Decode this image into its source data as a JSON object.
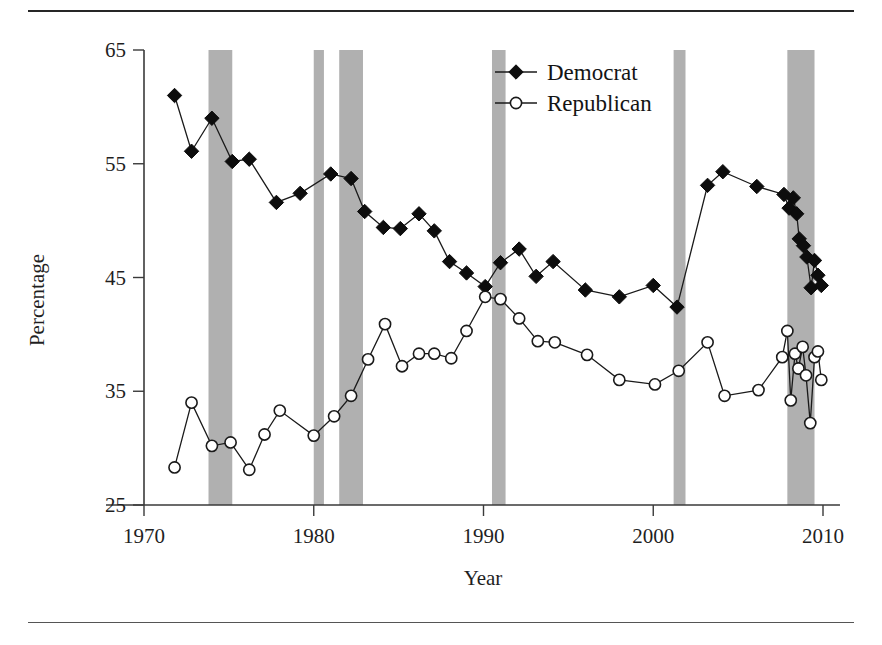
{
  "chart_data": {
    "type": "line",
    "title": "",
    "xlabel": "Year",
    "ylabel": "Percentage",
    "xlim": [
      1970.0,
      2011.0
    ],
    "ylim": [
      25,
      65
    ],
    "xticks": [
      1970,
      1980,
      1990,
      2000,
      2010
    ],
    "xtick_labels": [
      "1970",
      "1980",
      "1990",
      "2000",
      "2010"
    ],
    "yticks": [
      25,
      35,
      45,
      55,
      65
    ],
    "ytick_labels": [
      "25",
      "35",
      "45",
      "55",
      "65"
    ],
    "grid": false,
    "legend_position": "top-center",
    "legend": [
      "Democrat",
      "Republican"
    ],
    "shaded_bands_label": "recession",
    "shaded_bands": [
      {
        "start": 1973.8,
        "end": 1975.2
      },
      {
        "start": 1980.0,
        "end": 1980.6
      },
      {
        "start": 1981.5,
        "end": 1982.9
      },
      {
        "start": 1990.5,
        "end": 1991.3
      },
      {
        "start": 2001.2,
        "end": 2001.9
      },
      {
        "start": 2007.9,
        "end": 2009.5
      }
    ],
    "series": [
      {
        "name": "Democrat",
        "marker": "filled-diamond",
        "x": [
          1971.8,
          1972.8,
          1974.0,
          1975.2,
          1976.2,
          1977.8,
          1979.2,
          1981.0,
          1982.2,
          1983.0,
          1984.1,
          1985.1,
          1986.2,
          1987.1,
          1988.0,
          1989.0,
          1990.1,
          1991.0,
          1992.1,
          1993.1,
          1994.1,
          1996.0,
          1998.0,
          2000.0,
          2001.4,
          2003.2,
          2004.1,
          2006.1,
          2007.7,
          2008.0,
          2008.25,
          2008.45,
          2008.6,
          2008.85,
          2009.05,
          2009.3,
          2009.5,
          2009.7,
          2009.9
        ],
        "y": [
          61.0,
          56.1,
          59.0,
          55.2,
          55.4,
          51.6,
          52.4,
          54.1,
          53.7,
          50.8,
          49.4,
          49.3,
          50.6,
          49.1,
          46.4,
          45.4,
          44.2,
          46.3,
          47.5,
          45.1,
          46.4,
          43.9,
          43.3,
          44.3,
          42.4,
          53.1,
          54.3,
          53.0,
          52.3,
          51.1,
          52.0,
          50.6,
          48.4,
          47.8,
          46.8,
          44.1,
          46.5,
          45.2,
          44.3
        ]
      },
      {
        "name": "Republican",
        "marker": "open-circle",
        "x": [
          1971.8,
          1972.8,
          1974.0,
          1975.1,
          1976.2,
          1977.1,
          1978.0,
          1980.0,
          1981.2,
          1982.2,
          1983.2,
          1984.2,
          1985.2,
          1986.2,
          1987.1,
          1988.1,
          1989.0,
          1990.1,
          1991.0,
          1992.1,
          1993.2,
          1994.2,
          1996.1,
          1998.0,
          2000.1,
          2001.5,
          2003.2,
          2004.2,
          2006.2,
          2007.6,
          2007.9,
          2008.1,
          2008.35,
          2008.55,
          2008.8,
          2009.0,
          2009.25,
          2009.5,
          2009.7,
          2009.9
        ],
        "y": [
          28.3,
          34.0,
          30.2,
          30.5,
          28.1,
          31.2,
          33.3,
          31.1,
          32.8,
          34.6,
          37.8,
          40.9,
          37.2,
          38.3,
          38.3,
          37.9,
          40.3,
          43.3,
          43.1,
          41.4,
          39.4,
          39.3,
          38.2,
          36.0,
          35.6,
          36.8,
          39.3,
          34.6,
          35.1,
          38.0,
          40.3,
          34.2,
          38.3,
          37.0,
          38.9,
          36.4,
          32.2,
          38.0,
          38.5,
          36.0
        ]
      }
    ]
  },
  "figure": {
    "caption_rule_top": "",
    "caption_rule_bottom": ""
  }
}
